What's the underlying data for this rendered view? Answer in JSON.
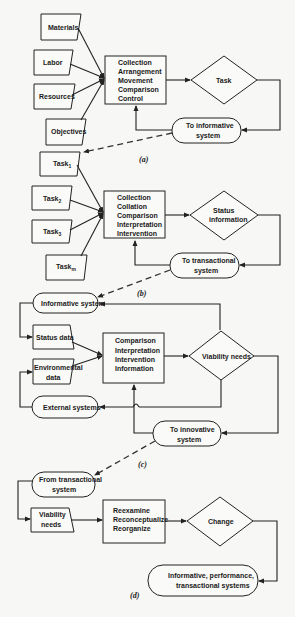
{
  "diagram": {
    "a": {
      "caption": "(a)",
      "inputs": [
        "Materials",
        "Labor",
        "Resources",
        "Objectives"
      ],
      "process": [
        "Collection",
        "Arrangement",
        "Movement",
        "Comparison",
        "Control"
      ],
      "decision": "Task",
      "terminal": [
        "To informative",
        "system"
      ]
    },
    "b": {
      "caption": "(b)",
      "inputs": [
        {
          "label": "Task",
          "sub": "1"
        },
        {
          "label": "Task",
          "sub": "2"
        },
        {
          "label": "Task",
          "sub": "3"
        },
        {
          "label": "Task",
          "sub": "m"
        }
      ],
      "process": [
        "Collection",
        "Collation",
        "Comparison",
        "Interpretation",
        "Intervention"
      ],
      "decision": [
        "Status",
        "information"
      ],
      "terminal": [
        "To transactional",
        "system"
      ]
    },
    "c": {
      "caption": "(c)",
      "top_terminal": "Informative system",
      "inputs": [
        [
          "Status data"
        ],
        [
          "Environmental",
          "data"
        ]
      ],
      "process": [
        "Comparison",
        "Interpretation",
        "Intervention",
        "Information"
      ],
      "decision": "Viability needs",
      "left_terminal": "External systems",
      "terminal": [
        "To innovative",
        "system"
      ]
    },
    "d": {
      "caption": "(d)",
      "start_terminal": [
        "From transactional",
        "system"
      ],
      "input": [
        "Viability",
        "needs"
      ],
      "process": [
        "Reexamine",
        "Reconceptualize",
        "Reorganize"
      ],
      "decision": "Change",
      "terminal": [
        "Informative,  performance,",
        "transactional systems"
      ]
    }
  }
}
